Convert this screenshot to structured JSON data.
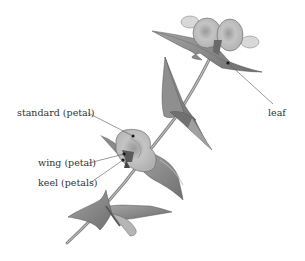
{
  "figure": {
    "labels": [
      {
        "id": "standard",
        "text": "standard (petal)"
      },
      {
        "id": "wing",
        "text": "wing (petal)"
      },
      {
        "id": "keel",
        "text": "keel (petals)"
      },
      {
        "id": "leaf",
        "text": "leaf"
      }
    ]
  },
  "colors": {
    "background": "#ffffff",
    "leaf_fill": "#8c8c8c",
    "leaf_dark": "#5e5e5e",
    "petal_fill": "#b8b8b8",
    "petal_light": "#d6d6d6",
    "stem": "#9a9a9a",
    "leader_line": "#555555",
    "label_text": "#333333"
  }
}
